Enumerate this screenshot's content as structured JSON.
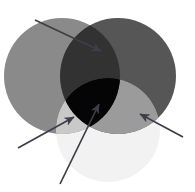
{
  "figure": {
    "width": 195,
    "height": 192,
    "background_color": "#ffffff"
  },
  "chart_data": {
    "type": "diagram",
    "subtype": "venn",
    "xlabel": "",
    "ylabel": "",
    "legend_position": "none",
    "grid": false,
    "sets": [
      {
        "name": "left-set",
        "label": "",
        "cx": 62,
        "cy": 76,
        "r": 58,
        "fill": "#8a8a8a",
        "opacity": 1.0
      },
      {
        "name": "right-set",
        "label": "",
        "cx": 118,
        "cy": 76,
        "r": 58,
        "fill": "#565656",
        "opacity": 1.0
      },
      {
        "name": "bottom-set",
        "label": "",
        "cx": 108,
        "cy": 130,
        "r": 52,
        "fill": "#f2f2f2",
        "opacity": 1.0
      }
    ],
    "regions": [
      {
        "name": "left-only",
        "label": "",
        "fill": "#8a8a8a"
      },
      {
        "name": "right-only",
        "label": "",
        "fill": "#565656"
      },
      {
        "name": "bottom-only",
        "label": "",
        "fill": "#f2f2f2"
      },
      {
        "name": "left-right-overlap",
        "label": "",
        "fill": "#323232"
      },
      {
        "name": "triple-overlap",
        "label": "",
        "fill": "#050505"
      },
      {
        "name": "left-bottom-overlap",
        "label": "",
        "fill": "#c9c9c9"
      },
      {
        "name": "right-bottom-overlap",
        "label": "",
        "fill": "#9b9b9b"
      }
    ],
    "annotations": [
      {
        "name": "annotation-arrow-top-left",
        "label": "",
        "target_region": "left-right-overlap",
        "x1": 35,
        "y1": 20,
        "x2": 101,
        "y2": 51,
        "color": "#3e3e4a"
      },
      {
        "name": "annotation-arrow-lower-left",
        "label": "",
        "target_region": "left-only",
        "x1": 18,
        "y1": 148,
        "x2": 74,
        "y2": 117,
        "color": "#3e3e4a"
      },
      {
        "name": "annotation-arrow-bottom-center",
        "label": "",
        "target_region": "triple-overlap",
        "x1": 60,
        "y1": 184,
        "x2": 99,
        "y2": 104,
        "color": "#3e3e4a"
      },
      {
        "name": "annotation-arrow-right",
        "label": "",
        "target_region": "right-bottom-overlap",
        "x1": 183,
        "y1": 137,
        "x2": 140,
        "y2": 114,
        "color": "#3e3e4a"
      }
    ],
    "palette": {
      "left_circle": "#8a8a8a",
      "right_circle": "#565656",
      "bottom_circle": "#f2f2f2",
      "left_right_overlap": "#323232",
      "triple_overlap": "#050505",
      "arrow_stroke": "#3e3e4a",
      "background": "#ffffff"
    }
  }
}
